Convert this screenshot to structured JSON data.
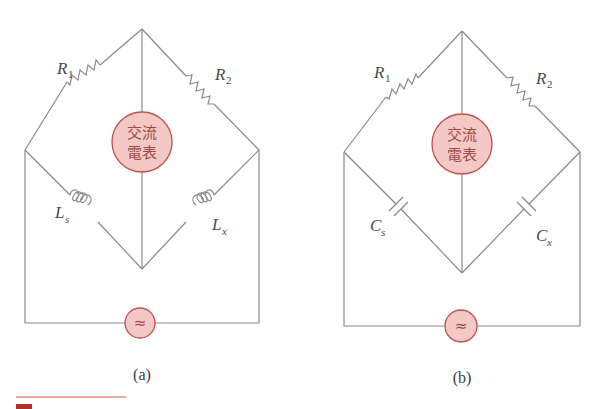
{
  "diagram": {
    "type": "AC bridge circuits",
    "colors": {
      "wire": "#8a8a8a",
      "meter_fill": "#f4c9c5",
      "meter_stroke": "#c0504d",
      "meter_text": "#9e4a4a",
      "accent_rule": "#d65a56"
    },
    "panels": [
      {
        "id": "a",
        "caption": "(a)",
        "meter_label_line1": "交流",
        "meter_label_line2": "電表",
        "source_symbol": "≈",
        "top_left": {
          "name": "R",
          "sub": "1"
        },
        "top_right": {
          "name": "R",
          "sub": "2"
        },
        "bottom_left": {
          "name": "L",
          "sub": "s"
        },
        "bottom_right": {
          "name": "L",
          "sub": "x"
        },
        "lower_component": "inductor"
      },
      {
        "id": "b",
        "caption": "(b)",
        "meter_label_line1": "交流",
        "meter_label_line2": "電表",
        "source_symbol": "≈",
        "top_left": {
          "name": "R",
          "sub": "1"
        },
        "top_right": {
          "name": "R",
          "sub": "2"
        },
        "bottom_left": {
          "name": "C",
          "sub": "s"
        },
        "bottom_right": {
          "name": "C",
          "sub": "x"
        },
        "lower_component": "capacitor"
      }
    ]
  }
}
